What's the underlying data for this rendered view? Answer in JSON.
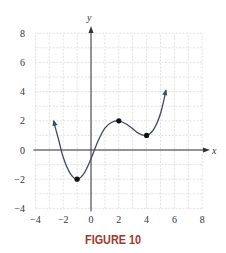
{
  "chart_data": {
    "type": "line",
    "title": "",
    "caption": "FIGURE 10",
    "xlabel": "x",
    "ylabel": "y",
    "xlim": [
      -4,
      8
    ],
    "ylim": [
      -4,
      8
    ],
    "x_ticks": [
      -4,
      -2,
      0,
      2,
      4,
      6,
      8
    ],
    "y_ticks": [
      -4,
      -2,
      0,
      2,
      4,
      6,
      8
    ],
    "x_tick_labels": [
      "−4",
      "−2",
      "0",
      "2",
      "4",
      "6",
      "8"
    ],
    "y_tick_labels": [
      "−4",
      "−2",
      "0",
      "2",
      "4",
      "6",
      "8"
    ],
    "grid": true,
    "grid_step": 1,
    "series": [
      {
        "name": "f(x)",
        "color": "#3d4a6b",
        "arrows_both_ends": true,
        "x": [
          -2.7,
          -2.3,
          -2.0,
          -1.5,
          -1.0,
          -0.5,
          0.0,
          0.5,
          1.0,
          1.5,
          2.0,
          2.5,
          3.0,
          3.5,
          4.0,
          4.5,
          5.0,
          5.4
        ],
        "y": [
          2.0,
          0.6,
          -0.5,
          -1.6,
          -2.0,
          -1.6,
          -0.6,
          0.6,
          1.5,
          1.9,
          2.0,
          1.8,
          1.45,
          1.1,
          1.0,
          1.4,
          2.5,
          4.1
        ]
      }
    ],
    "marked_points": [
      {
        "x": -1,
        "y": -2,
        "label": "local minimum"
      },
      {
        "x": 2,
        "y": 2,
        "label": "local maximum"
      },
      {
        "x": 4,
        "y": 1,
        "label": "local minimum"
      }
    ]
  },
  "figure": {
    "caption": "FIGURE 10",
    "x_axis_label": "x",
    "y_axis_label": "y"
  }
}
